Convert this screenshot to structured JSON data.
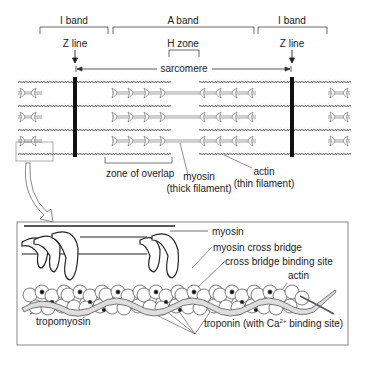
{
  "top": {
    "bands": [
      {
        "label": "I band",
        "x1": 40,
        "x2": 108
      },
      {
        "label": "A band",
        "x1": 112,
        "x2": 254
      },
      {
        "label": "I band",
        "x1": 258,
        "x2": 327
      }
    ],
    "z_line_left": "Z line",
    "z_line_right": "Z line",
    "h_zone": "H zone",
    "sarcomere": "sarcomere",
    "zone_of_overlap": "zone of overlap",
    "myosin": "myosin",
    "myosin_sub": "(thick filament)",
    "actin": "actin",
    "actin_sub": "(thin filament)"
  },
  "detail": {
    "myosin": "myosin",
    "cross_bridge": "myosin cross bridge",
    "binding_site": "cross bridge binding site",
    "actin": "actin",
    "tropomyosin": "tropomyosin",
    "troponin_pre": "troponin (with Ca",
    "troponin_sup": "2+",
    "troponin_post": " binding site)"
  },
  "colors": {
    "line": "#333333",
    "zline": "#111111",
    "filament": "#777777",
    "box_border": "#888888"
  }
}
